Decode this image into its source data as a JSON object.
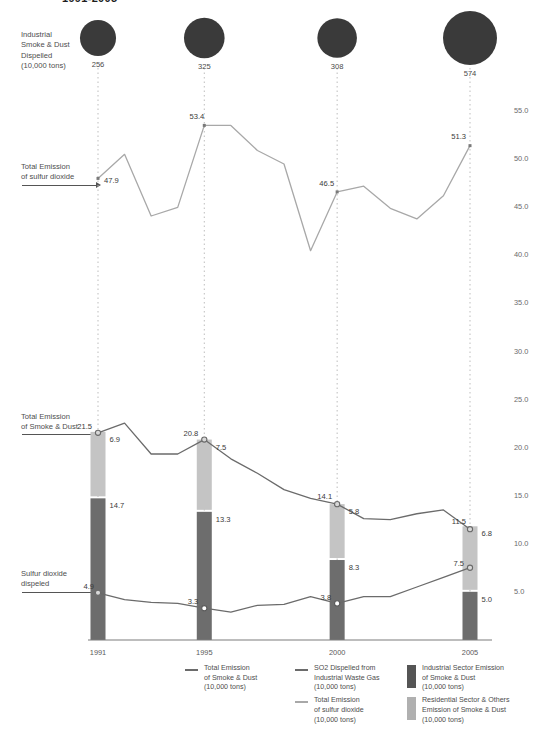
{
  "title": "1991-2005",
  "annotations": {
    "bubbles": "Industrial\nSmoke & Dust\nDispelled\n(10,000 tons)",
    "so2_total": "Total Emission\nof sulfur dioxide",
    "smoke_total": "Total Emission\nof Smoke & Dust",
    "so2_dispelled": "Sulfur dioxide\ndispeled"
  },
  "legend": {
    "items": [
      {
        "name": "legend-smoke-dust-line",
        "kind": "line",
        "color": "#6b6b6b",
        "label": "Total Emission\nof Smoke & Dust\n(10,000 tons)"
      },
      {
        "name": "legend-so2-industrial-line",
        "kind": "line",
        "color": "#6b6b6b",
        "label": "SO2  Dispelled from\nIndustrial Waste Gas\n(10,000 tons)"
      },
      {
        "name": "legend-so2-total-line",
        "kind": "line",
        "color": "#a8a8a8",
        "label": "Total Emission\nof sulfur dioxide\n(10,000 tons)"
      },
      {
        "name": "legend-industrial-sector-bar",
        "kind": "box",
        "color": "#6d6d6d",
        "label": "Industrial Sector Emission\nof Smoke & Dust\n(10,000 tons)"
      },
      {
        "name": "legend-residential-sector-bar",
        "kind": "box",
        "color": "#c4c4c4",
        "label": "Residential Sector & Others\nEmission of Smoke & Dust\n(10,000 tons)"
      }
    ]
  },
  "colors": {
    "bubble": "#3a3a3a",
    "bar_industrial": "#6d6d6d",
    "bar_residential": "#c4c4c4",
    "line_dark": "#6b6b6b",
    "line_light": "#a8a8a8",
    "axis": "#888888",
    "guide": "#bdbdbd"
  },
  "chart_data": {
    "type": "line",
    "title": "1991-2005",
    "xlabel": "",
    "ylabel": "",
    "ylim": [
      0,
      57.5
    ],
    "grid": false,
    "y_ticks": [
      55.0,
      50.0,
      45.0,
      40.0,
      35.0,
      30.0,
      25.0,
      20.0,
      15.0,
      10.0,
      5.0
    ],
    "y_tick_labels": [
      "55.0",
      "50.0",
      "45.0",
      "40.0",
      "35.0",
      "30.0",
      "25.0",
      "20.0",
      "15.0",
      "10.0",
      "5.0"
    ],
    "x": [
      1991,
      1992,
      1993,
      1994,
      1995,
      1996,
      1997,
      1998,
      1999,
      2000,
      2001,
      2002,
      2003,
      2004,
      2005
    ],
    "x_tick_values": [
      1991,
      1995,
      2000,
      2005
    ],
    "x_tick_labels": [
      "1991",
      "1995",
      "2000",
      "2005"
    ],
    "series": [
      {
        "name": "Total Emission of sulfur dioxide (10,000 tons)",
        "type": "line",
        "color": "#a8a8a8",
        "values": [
          47.9,
          50.4,
          44.0,
          44.9,
          53.4,
          53.4,
          50.8,
          49.4,
          40.4,
          46.5,
          47.1,
          44.8,
          43.7,
          46.1,
          51.3
        ],
        "labeled_points": [
          {
            "x": 1991,
            "y": 47.9,
            "label": "47.9"
          },
          {
            "x": 1995,
            "y": 53.4,
            "label": "53.4"
          },
          {
            "x": 2000,
            "y": 46.5,
            "label": "46.5"
          },
          {
            "x": 2005,
            "y": 51.3,
            "label": "51.3"
          }
        ]
      },
      {
        "name": "Total Emission of Smoke & Dust (10,000 tons)",
        "type": "line",
        "color": "#6b6b6b",
        "values": [
          21.5,
          22.5,
          19.3,
          19.3,
          20.8,
          18.8,
          17.3,
          15.6,
          14.7,
          14.1,
          12.6,
          12.5,
          13.1,
          13.5,
          11.5
        ],
        "labeled_points": [
          {
            "x": 1991,
            "y": 21.5,
            "label": "21.5"
          },
          {
            "x": 1995,
            "y": 20.8,
            "label": "20.8"
          },
          {
            "x": 2000,
            "y": 14.1,
            "label": "14.1"
          },
          {
            "x": 2005,
            "y": 11.5,
            "label": "11.5"
          }
        ]
      },
      {
        "name": "SO2 Dispelled from Industrial Waste Gas (10,000 tons)",
        "type": "line",
        "color": "#6b6b6b",
        "values": [
          4.9,
          4.2,
          3.9,
          3.8,
          3.3,
          2.9,
          3.6,
          3.7,
          4.5,
          3.8,
          4.5,
          4.5,
          5.5,
          6.5,
          7.5
        ],
        "labeled_points": [
          {
            "x": 1991,
            "y": 4.9,
            "label": "4.9"
          },
          {
            "x": 1995,
            "y": 3.3,
            "label": "3.3"
          },
          {
            "x": 2000,
            "y": 3.8,
            "label": "3.8"
          },
          {
            "x": 2005,
            "y": 7.5,
            "label": "7.5"
          }
        ]
      }
    ],
    "stacked_bars": {
      "type": "bar",
      "stacked": true,
      "categories": [
        "1991",
        "1995",
        "2000",
        "2005"
      ],
      "segments": [
        {
          "name": "Industrial Sector Emission of Smoke & Dust (10,000 tons)",
          "color": "#6d6d6d",
          "values": [
            14.7,
            13.3,
            8.3,
            5.0
          ],
          "labels": [
            "14.7",
            "13.3",
            "8.3",
            "5.0"
          ]
        },
        {
          "name": "Residential Sector & Others Emission of Smoke & Dust (10,000 tons)",
          "color": "#c4c4c4",
          "values": [
            6.9,
            7.5,
            5.8,
            6.8
          ],
          "labels": [
            "6.9",
            "7.5",
            "5.8",
            "6.8"
          ]
        }
      ],
      "totals": [
        21.5,
        20.8,
        14.1,
        11.5
      ]
    },
    "bubbles": {
      "name": "Industrial Smoke & Dust Dispelled (10,000 tons)",
      "color": "#3a3a3a",
      "categories": [
        "1991",
        "1995",
        "2000",
        "2005"
      ],
      "values": [
        256,
        325,
        308,
        574
      ],
      "labels": [
        "256",
        "325",
        "308",
        "574"
      ]
    }
  }
}
